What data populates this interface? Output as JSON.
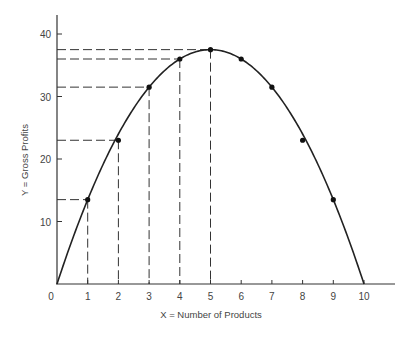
{
  "chart_data": {
    "type": "line",
    "title": "",
    "xlabel": "X = Number of Products",
    "ylabel": "Y = Gross Profits",
    "x": [
      0,
      1,
      2,
      3,
      4,
      5,
      6,
      7,
      8,
      9,
      10
    ],
    "series": [
      {
        "name": "Gross Profits",
        "values": [
          0,
          13.5,
          23,
          31.5,
          36,
          37.5,
          36,
          31.5,
          23,
          13.5,
          0
        ],
        "markers": [
          false,
          true,
          true,
          true,
          true,
          true,
          true,
          true,
          true,
          true,
          false
        ]
      }
    ],
    "xlim": [
      0,
      10.5
    ],
    "ylim": [
      0,
      42
    ],
    "x_ticks": [
      "0",
      "1",
      "2",
      "3",
      "4",
      "5",
      "6",
      "7",
      "8",
      "9",
      "10"
    ],
    "y_ticks": [
      "10",
      "20",
      "30",
      "40"
    ],
    "grid": false,
    "legend": "none",
    "annotations": {
      "dashed_projection_x": [
        1,
        2,
        3,
        4,
        5
      ],
      "note": "Dashed lines drop from points at x=1..5 to both axes"
    },
    "color": "#222222"
  }
}
